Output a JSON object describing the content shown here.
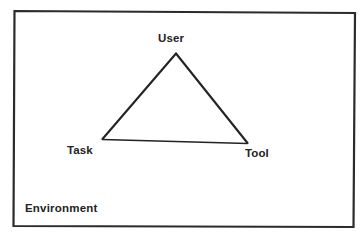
{
  "diagram": {
    "title_text": "",
    "boundary": {
      "label": "Environment",
      "shape": "rectangle",
      "stroke_color": "#2b2b2b"
    },
    "triangle": {
      "stroke_color": "#232323",
      "fill": "none",
      "vertices": [
        {
          "id": "user",
          "label": "User",
          "role": "top-apex"
        },
        {
          "id": "task",
          "label": "Task",
          "role": "bottom-left"
        },
        {
          "id": "tool",
          "label": "Tool",
          "role": "bottom-right"
        }
      ],
      "edges": [
        {
          "from": "task",
          "to": "user"
        },
        {
          "from": "user",
          "to": "tool"
        },
        {
          "from": "task",
          "to": "tool"
        }
      ]
    },
    "colors": {
      "background": "#ffffff",
      "ink": "#232323",
      "border": "#2b2b2b"
    }
  }
}
